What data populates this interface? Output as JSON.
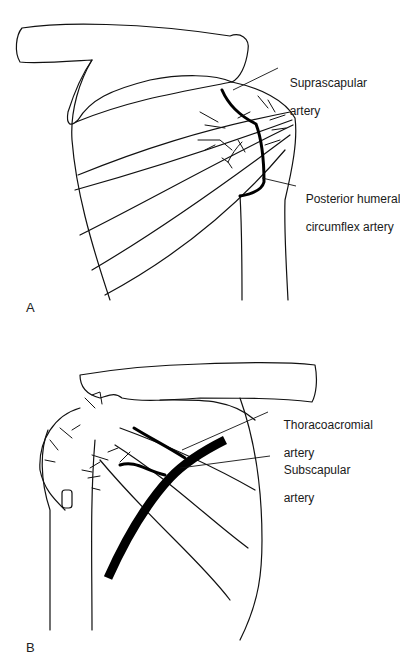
{
  "figure": {
    "panels": [
      {
        "letter": "A",
        "view": "posterior shoulder",
        "labels": [
          {
            "line1": "Suprascapular",
            "line2": "artery"
          },
          {
            "line1": "Posterior humeral",
            "line2": "circumflex artery"
          }
        ]
      },
      {
        "letter": "B",
        "view": "anterior shoulder",
        "labels": [
          {
            "line1": "Thoracoacromial",
            "line2": "artery"
          },
          {
            "line1": "Subscapular",
            "line2": "artery"
          }
        ]
      }
    ],
    "colors": {
      "line": "#111111",
      "background": "#ffffff"
    }
  }
}
